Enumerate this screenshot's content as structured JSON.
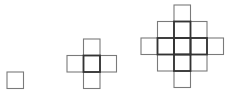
{
  "diagram": {
    "type": "square-growth-pattern",
    "cell_size": 16.5,
    "colors": {
      "thin": "#7a7a7a",
      "bold": "#333333",
      "background": "#ffffff"
    },
    "figures": [
      {
        "name": "figure-1",
        "square_count": 1,
        "origin": [
          7,
          72
        ],
        "cells": [
          [
            0,
            0
          ]
        ],
        "bold": []
      },
      {
        "name": "figure-2",
        "square_count": 5,
        "origin": [
          67,
          39
        ],
        "cells": [
          [
            1,
            0
          ],
          [
            0,
            1
          ],
          [
            1,
            1
          ],
          [
            2,
            1
          ],
          [
            1,
            2
          ]
        ],
        "bold": [
          [
            1,
            1
          ]
        ]
      },
      {
        "name": "figure-3",
        "square_count": 13,
        "origin": [
          141,
          5
        ],
        "cells": [
          [
            2,
            0
          ],
          [
            1,
            1
          ],
          [
            2,
            1
          ],
          [
            3,
            1
          ],
          [
            0,
            2
          ],
          [
            1,
            2
          ],
          [
            2,
            2
          ],
          [
            3,
            2
          ],
          [
            4,
            2
          ],
          [
            1,
            3
          ],
          [
            2,
            3
          ],
          [
            3,
            3
          ],
          [
            2,
            4
          ]
        ],
        "bold": [
          [
            2,
            1
          ],
          [
            1,
            2
          ],
          [
            2,
            2
          ],
          [
            3,
            2
          ],
          [
            2,
            3
          ]
        ]
      }
    ]
  }
}
